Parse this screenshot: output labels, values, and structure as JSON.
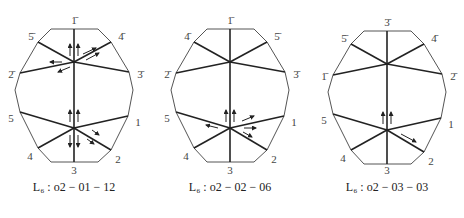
{
  "diagrams": [
    {
      "caption": "L₆ : o2 − 01 − 12",
      "labels": {
        "top": "1̄",
        "upper_left": "5̄",
        "upper_right": "4̄",
        "mid_left": "2̄",
        "mid_right": "3̄",
        "lower_left": "5",
        "lower_right": "1",
        "bottom_left": "4",
        "bottom_right": "2",
        "bottom": "3"
      }
    },
    {
      "caption": "L₆ : o2 − 02 − 06",
      "labels": {
        "top": "1̄",
        "upper_left": "4̄",
        "upper_right": "5̄",
        "mid_left": "2̄",
        "mid_right": "3̄",
        "lower_left": "5",
        "lower_right": "1",
        "bottom_left": "4",
        "bottom_right": "2",
        "bottom": "3"
      }
    },
    {
      "caption": "L₆ : o2 − 03 − 03",
      "labels": {
        "top": "3̄",
        "upper_left": "5̄",
        "upper_right": "4̄",
        "mid_left": "1̄",
        "mid_right": "2̄",
        "lower_left": "5",
        "lower_right": "1",
        "bottom_left": "4",
        "bottom_right": "2",
        "bottom": "3"
      }
    }
  ]
}
